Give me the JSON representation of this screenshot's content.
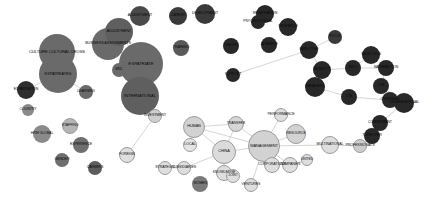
{
  "figure": {
    "type": "network-graph",
    "title": "",
    "background": "#ffffff",
    "width": 432,
    "height": 206
  },
  "palette": {
    "cluster_dark": "#5a5a5a",
    "cluster_black": "#262626",
    "cluster_light": "#d8d8d8",
    "cluster_mid": "#9a9a9a",
    "edge": "#b8b8b8",
    "label_dark": "#0a0a0a",
    "label_light": "#111111"
  },
  "chart_data": {
    "type": "scatter",
    "title": "",
    "xlabel": "",
    "ylabel": "",
    "legend": [],
    "nodes": [
      {
        "id": "expatriation",
        "label": "EXPATRIATION",
        "x": 26,
        "y": 90,
        "r": 9,
        "color": "#2e2e2e",
        "fontsize": 3.6,
        "cluster": "dark"
      },
      {
        "id": "country",
        "label": "COUNTRY",
        "x": 28,
        "y": 110,
        "r": 6,
        "color": "#8a8a8a",
        "fontsize": 3.6,
        "cluster": "mid"
      },
      {
        "id": "hrm-global",
        "label": "HRM GLOBAL",
        "x": 42,
        "y": 134,
        "r": 9,
        "color": "#8a8a8a",
        "fontsize": 3.6,
        "cluster": "mid"
      },
      {
        "id": "gender",
        "label": "GENDER",
        "x": 62,
        "y": 160,
        "r": 7,
        "color": "#6f6f6f",
        "fontsize": 3.6,
        "cluster": "mid"
      },
      {
        "id": "staffing",
        "label": "STAFFING",
        "x": 70,
        "y": 126,
        "r": 8,
        "color": "#b5b5b5",
        "fontsize": 3.6,
        "cluster": "light"
      },
      {
        "id": "experience",
        "label": "EXPERIENCE",
        "x": 81,
        "y": 145,
        "r": 8,
        "color": "#6f6f6f",
        "fontsize": 3.6,
        "cluster": "mid"
      },
      {
        "id": "careers",
        "label": "CAREERS",
        "x": 95,
        "y": 168,
        "r": 7,
        "color": "#5d5d5d",
        "fontsize": 3.6,
        "cluster": "mid"
      },
      {
        "id": "culture-cultural-cross",
        "label": "CULTURE CULTURAL CROSS",
        "x": 57,
        "y": 52,
        "r": 18,
        "color": "#6a6a6a",
        "fontsize": 4.2,
        "cluster": "dark"
      },
      {
        "id": "expatriates",
        "label": "EXPATRIATES",
        "x": 58,
        "y": 74,
        "r": 19,
        "color": "#6a6a6a",
        "fontsize": 4.2,
        "cluster": "dark"
      },
      {
        "id": "learning",
        "label": "LEARNING",
        "x": 86,
        "y": 92,
        "r": 7,
        "color": "#6a6a6a",
        "fontsize": 3.6,
        "cluster": "mid"
      },
      {
        "id": "business-assignments",
        "label": "BUSINESS ASSIGNMENTS",
        "x": 108,
        "y": 44,
        "r": 16,
        "color": "#6a6a6a",
        "fontsize": 3.8,
        "cluster": "dark"
      },
      {
        "id": "adjustment-left",
        "label": "ADJUSTMENT",
        "x": 119,
        "y": 32,
        "r": 14,
        "color": "#5f5f5f",
        "fontsize": 3.8,
        "cluster": "dark"
      },
      {
        "id": "adjustment-top",
        "label": "ADJUSTMENT",
        "x": 140,
        "y": 16,
        "r": 10,
        "color": "#4a4a4a",
        "fontsize": 3.8,
        "cluster": "dark"
      },
      {
        "id": "expatriate",
        "label": "EXPATRIATE",
        "x": 141,
        "y": 64,
        "r": 22,
        "color": "#6a6a6a",
        "fontsize": 4.4,
        "cluster": "dark"
      },
      {
        "id": "mnc",
        "label": "MNC",
        "x": 119,
        "y": 70,
        "r": 7,
        "color": "#6a6a6a",
        "fontsize": 3.4,
        "cluster": "mid"
      },
      {
        "id": "international",
        "label": "INTERNATIONAL",
        "x": 140,
        "y": 96,
        "r": 19,
        "color": "#5f5f5f",
        "fontsize": 4.2,
        "cluster": "dark"
      },
      {
        "id": "investment",
        "label": "INVESTMENT",
        "x": 155,
        "y": 116,
        "r": 7,
        "color": "#cfcfcf",
        "fontsize": 3.6,
        "cluster": "light"
      },
      {
        "id": "foreign",
        "label": "FOREIGN",
        "x": 127,
        "y": 155,
        "r": 8,
        "color": "#dedede",
        "fontsize": 3.6,
        "cluster": "light"
      },
      {
        "id": "strategic",
        "label": "STRATEGIC",
        "x": 165,
        "y": 168,
        "r": 7,
        "color": "#dedede",
        "fontsize": 3.6,
        "cluster": "light"
      },
      {
        "id": "subsidiaries",
        "label": "SUBSIDIARIES",
        "x": 184,
        "y": 168,
        "r": 7,
        "color": "#dedede",
        "fontsize": 3.6,
        "cluster": "light"
      },
      {
        "id": "local",
        "label": "LOCAL",
        "x": 190,
        "y": 145,
        "r": 7,
        "color": "#e4e4e4",
        "fontsize": 3.6,
        "cluster": "light"
      },
      {
        "id": "human",
        "label": "HUMAN",
        "x": 194,
        "y": 127,
        "r": 11,
        "color": "#d2d2d2",
        "fontsize": 3.8,
        "cluster": "light"
      },
      {
        "id": "china",
        "label": "CHINA",
        "x": 224,
        "y": 152,
        "r": 12,
        "color": "#dbdbdb",
        "fontsize": 3.8,
        "cluster": "light"
      },
      {
        "id": "knowledge",
        "label": "KNOWLEDGE",
        "x": 224,
        "y": 173,
        "r": 8,
        "color": "#dedede",
        "fontsize": 3.6,
        "cluster": "light"
      },
      {
        "id": "joint",
        "label": "JOINT",
        "x": 233,
        "y": 176,
        "r": 7,
        "color": "#dedede",
        "fontsize": 3.4,
        "cluster": "light"
      },
      {
        "id": "women",
        "label": "WOMEN",
        "x": 200,
        "y": 184,
        "r": 8,
        "color": "#7a7a7a",
        "fontsize": 3.6,
        "cluster": "mid"
      },
      {
        "id": "transfer",
        "label": "TRANSFER",
        "x": 236,
        "y": 124,
        "r": 8,
        "color": "#d6d6d6",
        "fontsize": 3.6,
        "cluster": "light"
      },
      {
        "id": "performance",
        "label": "PERFORMANCE",
        "x": 281,
        "y": 115,
        "r": 7,
        "color": "#dedede",
        "fontsize": 3.6,
        "cluster": "light"
      },
      {
        "id": "resource",
        "label": "RESOURCE",
        "x": 296,
        "y": 134,
        "r": 10,
        "color": "#d2d2d2",
        "fontsize": 3.6,
        "cluster": "light"
      },
      {
        "id": "management",
        "label": "MANAGEMENT",
        "x": 264,
        "y": 146,
        "r": 16,
        "color": "#d2d2d2",
        "fontsize": 4.0,
        "cluster": "light"
      },
      {
        "id": "corporations",
        "label": "CORPORATIONS",
        "x": 272,
        "y": 165,
        "r": 8,
        "color": "#dedede",
        "fontsize": 3.6,
        "cluster": "light"
      },
      {
        "id": "companies",
        "label": "COMPANIES",
        "x": 290,
        "y": 165,
        "r": 8,
        "color": "#dedede",
        "fontsize": 3.6,
        "cluster": "light"
      },
      {
        "id": "united",
        "label": "UNITED",
        "x": 307,
        "y": 160,
        "r": 6,
        "color": "#dedede",
        "fontsize": 3.4,
        "cluster": "light"
      },
      {
        "id": "ventures",
        "label": "VENTURES",
        "x": 251,
        "y": 185,
        "r": 7,
        "color": "#dedede",
        "fontsize": 3.6,
        "cluster": "light"
      },
      {
        "id": "multinational",
        "label": "MULTINATIONAL",
        "x": 330,
        "y": 145,
        "r": 9,
        "color": "#dedede",
        "fontsize": 3.6,
        "cluster": "light"
      },
      {
        "id": "professionals",
        "label": "PROFESSIONALS",
        "x": 360,
        "y": 146,
        "r": 7,
        "color": "#cccccc",
        "fontsize": 3.6,
        "cluster": "light"
      },
      {
        "id": "repatriation",
        "label": "REPATRIATION",
        "x": 265,
        "y": 14,
        "r": 9,
        "color": "#282828",
        "fontsize": 3.6,
        "cluster": "black"
      },
      {
        "id": "psychological",
        "label": "PSYCHOLOGICAL",
        "x": 258,
        "y": 22,
        "r": 7,
        "color": "#282828",
        "fontsize": 3.6,
        "cluster": "black"
      },
      {
        "id": "research",
        "label": "RESEARCH",
        "x": 288,
        "y": 27,
        "r": 9,
        "color": "#282828",
        "fontsize": 3.6,
        "cluster": "black"
      },
      {
        "id": "career",
        "label": "CAREER",
        "x": 178,
        "y": 16,
        "r": 9,
        "color": "#3a3a3a",
        "fontsize": 3.6,
        "cluster": "black"
      },
      {
        "id": "development",
        "label": "DEVELOPMENT",
        "x": 205,
        "y": 14,
        "r": 10,
        "color": "#3a3a3a",
        "fontsize": 3.6,
        "cluster": "black"
      },
      {
        "id": "training",
        "label": "TRAINING",
        "x": 181,
        "y": 48,
        "r": 8,
        "color": "#5a5a5a",
        "fontsize": 3.6,
        "cluster": "dark"
      },
      {
        "id": "theory",
        "label": "THEORY",
        "x": 231,
        "y": 46,
        "r": 8,
        "color": "#282828",
        "fontsize": 3.6,
        "cluster": "black"
      },
      {
        "id": "japanese",
        "label": "JAPANESE",
        "x": 269,
        "y": 45,
        "r": 8,
        "color": "#282828",
        "fontsize": 3.6,
        "cluster": "black"
      },
      {
        "id": "support",
        "label": "SUPPORT",
        "x": 233,
        "y": 75,
        "r": 7,
        "color": "#282828",
        "fontsize": 3.6,
        "cluster": "black"
      },
      {
        "id": "employee",
        "label": "EMPLOYEE",
        "x": 309,
        "y": 50,
        "r": 9,
        "color": "#282828",
        "fontsize": 3.6,
        "cluster": "black"
      },
      {
        "id": "focus",
        "label": "FOCUS",
        "x": 335,
        "y": 37,
        "r": 7,
        "color": "#3a3a3a",
        "fontsize": 3.4,
        "cluster": "black"
      },
      {
        "id": "mobility",
        "label": "MOBILITY",
        "x": 322,
        "y": 70,
        "r": 9,
        "color": "#282828",
        "fontsize": 3.6,
        "cluster": "black"
      },
      {
        "id": "managers",
        "label": "MANAGERS",
        "x": 315,
        "y": 87,
        "r": 10,
        "color": "#282828",
        "fontsize": 3.6,
        "cluster": "black"
      },
      {
        "id": "job",
        "label": "JOB",
        "x": 349,
        "y": 97,
        "r": 8,
        "color": "#282828",
        "fontsize": 3.4,
        "cluster": "black"
      },
      {
        "id": "selection",
        "label": "SELECTION",
        "x": 371,
        "y": 55,
        "r": 9,
        "color": "#282828",
        "fontsize": 3.6,
        "cluster": "black"
      },
      {
        "id": "mnc2",
        "label": "MNCs",
        "x": 353,
        "y": 68,
        "r": 8,
        "color": "#282828",
        "fontsize": 3.4,
        "cluster": "black"
      },
      {
        "id": "satisfaction",
        "label": "SATISFACTION",
        "x": 386,
        "y": 68,
        "r": 8,
        "color": "#282828",
        "fontsize": 3.6,
        "cluster": "black"
      },
      {
        "id": "job2",
        "label": "JOB",
        "x": 381,
        "y": 86,
        "r": 8,
        "color": "#282828",
        "fontsize": 3.4,
        "cluster": "black"
      },
      {
        "id": "overseas",
        "label": "OVERSEAS",
        "x": 390,
        "y": 100,
        "r": 8,
        "color": "#282828",
        "fontsize": 3.6,
        "cluster": "black"
      },
      {
        "id": "organizational",
        "label": "ORGANIZATIONAL",
        "x": 404,
        "y": 103,
        "r": 10,
        "color": "#282828",
        "fontsize": 3.6,
        "cluster": "black"
      },
      {
        "id": "commitment",
        "label": "COMMITMENT",
        "x": 380,
        "y": 123,
        "r": 8,
        "color": "#282828",
        "fontsize": 3.6,
        "cluster": "black"
      },
      {
        "id": "turnover",
        "label": "TURNOVER",
        "x": 372,
        "y": 136,
        "r": 8,
        "color": "#282828",
        "fontsize": 3.6,
        "cluster": "black"
      }
    ],
    "edges": [
      {
        "source": "expatriate",
        "target": "mnc"
      },
      {
        "source": "expatriate",
        "target": "business-assignments"
      },
      {
        "source": "expatriate",
        "target": "international"
      },
      {
        "source": "expatriate",
        "target": "adjustment-left"
      },
      {
        "source": "international",
        "target": "investment"
      },
      {
        "source": "investment",
        "target": "foreign"
      },
      {
        "source": "human",
        "target": "transfer"
      },
      {
        "source": "human",
        "target": "local"
      },
      {
        "source": "human",
        "target": "china"
      },
      {
        "source": "human",
        "target": "management"
      },
      {
        "source": "transfer",
        "target": "management"
      },
      {
        "source": "transfer",
        "target": "china"
      },
      {
        "source": "china",
        "target": "knowledge"
      },
      {
        "source": "china",
        "target": "management"
      },
      {
        "source": "knowledge",
        "target": "joint"
      },
      {
        "source": "subsidiaries",
        "target": "china"
      },
      {
        "source": "strategic",
        "target": "subsidiaries"
      },
      {
        "source": "management",
        "target": "resource"
      },
      {
        "source": "management",
        "target": "performance"
      },
      {
        "source": "management",
        "target": "corporations"
      },
      {
        "source": "management",
        "target": "companies"
      },
      {
        "source": "management",
        "target": "ventures"
      },
      {
        "source": "management",
        "target": "multinational"
      },
      {
        "source": "multinational",
        "target": "professionals"
      },
      {
        "source": "companies",
        "target": "united"
      },
      {
        "source": "support",
        "target": "employee"
      },
      {
        "source": "employee",
        "target": "focus"
      },
      {
        "source": "employee",
        "target": "mobility"
      },
      {
        "source": "mobility",
        "target": "managers"
      },
      {
        "source": "mobility",
        "target": "mnc2"
      },
      {
        "source": "mnc2",
        "target": "satisfaction"
      },
      {
        "source": "mnc2",
        "target": "selection"
      },
      {
        "source": "managers",
        "target": "job"
      },
      {
        "source": "job",
        "target": "overseas"
      },
      {
        "source": "overseas",
        "target": "organizational"
      },
      {
        "source": "organizational",
        "target": "commitment"
      },
      {
        "source": "commitment",
        "target": "turnover"
      },
      {
        "source": "satisfaction",
        "target": "job2"
      },
      {
        "source": "job2",
        "target": "organizational"
      },
      {
        "source": "turnover",
        "target": "professionals"
      },
      {
        "source": "expatriates",
        "target": "culture-cultural-cross"
      },
      {
        "source": "expatriates",
        "target": "expatriation"
      },
      {
        "source": "expatriates",
        "target": "learning"
      }
    ]
  }
}
